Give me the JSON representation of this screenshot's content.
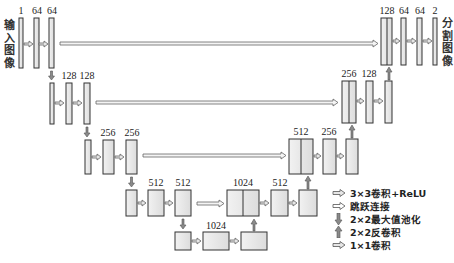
{
  "diagram": {
    "type": "U-Net architecture",
    "input_label": "输入图像",
    "output_label": "分割图像",
    "colors": {
      "box_fill": "#e8e8e8",
      "box_stroke": "#333333",
      "arrow_fill": "#d9d9d9",
      "arrow_stroke": "#555555",
      "updown_fill": "#888888"
    },
    "encoder": [
      {
        "level": 1,
        "channels": [
          "1",
          "64",
          "64"
        ]
      },
      {
        "level": 2,
        "channels": [
          "",
          "128",
          "128"
        ]
      },
      {
        "level": 3,
        "channels": [
          "",
          "256",
          "256"
        ]
      },
      {
        "level": 4,
        "channels": [
          "",
          "512",
          "512"
        ]
      }
    ],
    "bottleneck": {
      "channels": [
        "",
        "1024",
        ""
      ]
    },
    "decoder": [
      {
        "level": 4,
        "channels": [
          "1024",
          "512",
          ""
        ]
      },
      {
        "level": 3,
        "channels": [
          "512",
          "256",
          ""
        ]
      },
      {
        "level": 2,
        "channels": [
          "256",
          "128",
          ""
        ]
      },
      {
        "level": 1,
        "channels": [
          "128",
          "64",
          "64",
          "2"
        ]
      }
    ],
    "labels": {
      "l1_a": "1",
      "l1_b": "64",
      "l1_c": "64",
      "l2_b": "128",
      "l2_c": "128",
      "l3_b": "256",
      "l3_c": "256",
      "l4_b": "512",
      "l4_c": "512",
      "bn": "1024",
      "d4_cat": "1024",
      "d4_b": "512",
      "d3_cat": "512",
      "d3_b": "256",
      "d2_cat": "256",
      "d2_b": "128",
      "d1_cat": "128",
      "d1_b": "64",
      "d1_c": "64",
      "d1_out": "2"
    }
  },
  "legend": {
    "items": [
      {
        "icon": "right-arrow-icon",
        "label": "3×3卷积+ReLU"
      },
      {
        "icon": "skip-arrow-icon",
        "label": "跳跃连接"
      },
      {
        "icon": "down-arrow-icon",
        "label": "2×2最大值池化"
      },
      {
        "icon": "up-arrow-icon",
        "label": "2×2反卷积"
      },
      {
        "icon": "right-arrow-icon",
        "label": "1×1卷积"
      }
    ]
  }
}
